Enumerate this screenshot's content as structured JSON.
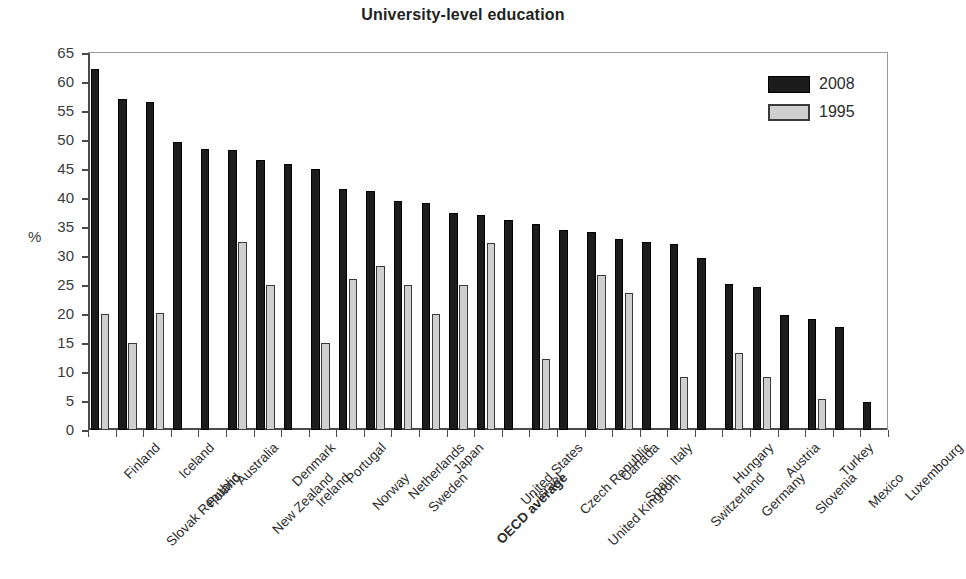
{
  "chart_data": {
    "type": "bar",
    "title": "University-level education",
    "xlabel": "",
    "ylabel": "%",
    "ylim": [
      0,
      65
    ],
    "yticks": [
      0,
      5,
      10,
      15,
      20,
      25,
      30,
      35,
      40,
      45,
      50,
      55,
      60,
      65
    ],
    "grid": true,
    "legend_position": "top-right",
    "legend": [
      "2008",
      "1995"
    ],
    "highlight_category": "OECD average",
    "categories": [
      "Finland",
      "Slovak Republic",
      "Iceland",
      "Poland",
      "Australia",
      "New Zealand",
      "Denmark",
      "Ireland",
      "Portugal",
      "Norway",
      "Netherlands",
      "Sweden",
      "Japan",
      "OECD average",
      "United States",
      "Israel",
      "Czech Republic",
      "United Kingdom",
      "Canada",
      "Spain",
      "Italy",
      "Switzerland",
      "Hungary",
      "Germany",
      "Austria",
      "Slovenia",
      "Turkey",
      "Mexico",
      "Luxembourg"
    ],
    "series": [
      {
        "name": "2008",
        "color": "#1c1c1c",
        "values": [
          62.2,
          57.0,
          56.5,
          49.7,
          48.5,
          48.2,
          46.5,
          45.8,
          45.0,
          41.5,
          41.2,
          39.5,
          39.2,
          37.5,
          37.0,
          36.2,
          35.6,
          34.4,
          34.2,
          33.0,
          32.5,
          32.0,
          29.6,
          25.2,
          24.6,
          19.8,
          19.2,
          17.7,
          4.8
        ]
      },
      {
        "name": "1995",
        "color": "#cfcfcf",
        "values": [
          20.0,
          15.0,
          20.2,
          null,
          null,
          32.5,
          25.0,
          null,
          15.0,
          26.0,
          28.2,
          25.0,
          20.0,
          25.0,
          32.2,
          null,
          12.3,
          null,
          26.8,
          23.7,
          null,
          9.2,
          null,
          13.2,
          9.1,
          null,
          5.3,
          null,
          null
        ]
      }
    ]
  }
}
